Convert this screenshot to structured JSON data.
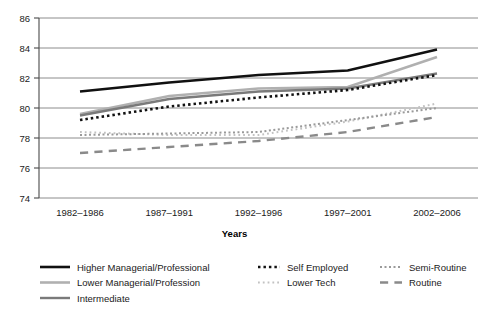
{
  "chart_data": {
    "type": "line",
    "title": "",
    "xlabel": "Years",
    "ylabel": "",
    "ylim": [
      74,
      86
    ],
    "ytick_step": 2,
    "yticks": [
      74,
      76,
      78,
      80,
      82,
      84,
      86
    ],
    "grid": true,
    "legend_position": "bottom",
    "legend_columns": 3,
    "categories": [
      "1982–1986",
      "1987–1991",
      "1992–1996",
      "1997–2001",
      "2002–2006"
    ],
    "series": [
      {
        "name": "Higher Managerial/Professional",
        "style": "solid",
        "color": "#111111",
        "width": 2.6,
        "values": [
          81.1,
          81.7,
          82.2,
          82.5,
          83.9
        ]
      },
      {
        "name": "Lower Managerial/Profession",
        "style": "solid",
        "color": "#b0b0b0",
        "width": 2.6,
        "values": [
          79.6,
          80.8,
          81.3,
          81.4,
          83.4
        ]
      },
      {
        "name": "Intermediate",
        "style": "solid",
        "color": "#7a7a7a",
        "width": 2.4,
        "values": [
          79.5,
          80.6,
          81.1,
          81.3,
          82.3
        ]
      },
      {
        "name": "Self Employed",
        "style": "dotted-thick",
        "color": "#111111",
        "width": 2.6,
        "values": [
          79.2,
          80.1,
          80.7,
          81.2,
          82.2
        ]
      },
      {
        "name": "Lower Tech",
        "style": "dotted-fine",
        "color": "#c2c2c2",
        "width": 2.0,
        "values": [
          78.4,
          78.2,
          78.2,
          79.1,
          80.3
        ]
      },
      {
        "name": "Semi-Routine",
        "style": "dotted-medium",
        "color": "#9a9a9a",
        "width": 2.0,
        "values": [
          78.2,
          78.3,
          78.4,
          79.2,
          80.0
        ]
      },
      {
        "name": "Routine",
        "style": "dashed-long",
        "color": "#8a8a8a",
        "width": 2.4,
        "values": [
          77.0,
          77.4,
          77.8,
          78.4,
          79.4
        ]
      }
    ]
  },
  "legend": {
    "columns": [
      [
        "Higher Managerial/Professional",
        "Lower Managerial/Profession",
        "Intermediate"
      ],
      [
        "Self Employed",
        "Lower Tech"
      ],
      [
        "Semi-Routine",
        "Routine"
      ]
    ]
  }
}
